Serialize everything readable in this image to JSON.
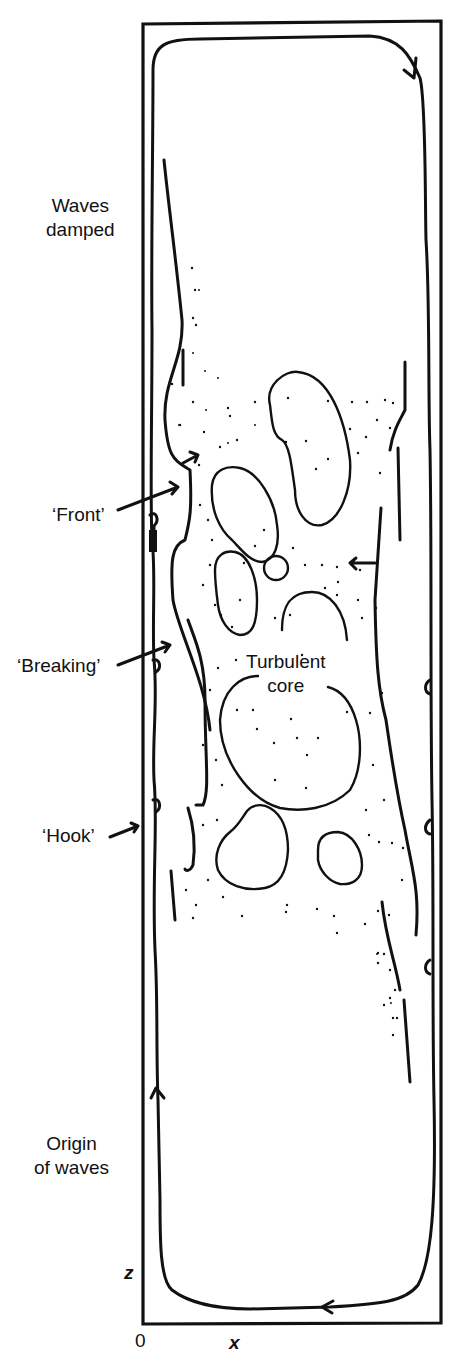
{
  "labels": {
    "waves_damped": [
      "Waves",
      "damped"
    ],
    "front": "‘Front’",
    "breaking": "‘Breaking’",
    "hook": "‘Hook’",
    "turbulent_core": [
      "Turbulent",
      "core"
    ],
    "origin_of_waves": [
      "Origin",
      "of waves"
    ]
  },
  "axes": {
    "origin": "0",
    "x": "x",
    "z": "z"
  },
  "colors": {
    "ink": "#111111",
    "background": "#ffffff"
  }
}
